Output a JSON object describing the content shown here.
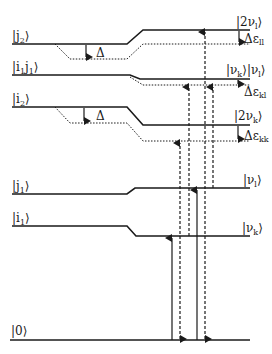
{
  "diagram": {
    "left_levels": [
      {
        "id": "j2",
        "ket": "|j",
        "sub": "2",
        "close": "⟩"
      },
      {
        "id": "i1j1",
        "ket": "|i",
        "sub": "1",
        "ket2": "j",
        "sub2": "1",
        "close": "⟩"
      },
      {
        "id": "i2",
        "ket": "|i",
        "sub": "2",
        "close": "⟩"
      },
      {
        "id": "j1",
        "ket": "|j",
        "sub": "1",
        "close": "⟩"
      },
      {
        "id": "i1",
        "ket": "|i",
        "sub": "1",
        "close": "⟩"
      },
      {
        "id": "zero",
        "ket": "|0",
        "close": "⟩"
      }
    ],
    "right_levels": [
      {
        "id": "2nu_l",
        "ket": "|2ν",
        "sub": "l",
        "close": "⟩"
      },
      {
        "id": "nu_k_nu_l",
        "ket": "|ν",
        "sub": "k",
        "ket2": "⟩|ν",
        "sub2": "l",
        "close": "⟩"
      },
      {
        "id": "2nu_k",
        "ket": "|2ν",
        "sub": "k",
        "close": "⟩"
      },
      {
        "id": "nu_l",
        "ket": "|ν",
        "sub": "l",
        "close": "⟩"
      },
      {
        "id": "nu_k",
        "ket": "|ν",
        "sub": "k",
        "close": "⟩"
      }
    ],
    "shifts": [
      {
        "id": "delta_j2",
        "label": "Δ"
      },
      {
        "id": "delta_i2",
        "label": "Δ"
      }
    ],
    "anharmonicities": [
      {
        "id": "eps_ll",
        "label": "Δε",
        "sub": "ll"
      },
      {
        "id": "eps_kl",
        "label": "Δε",
        "sub": "kl"
      },
      {
        "id": "eps_kk",
        "label": "Δε",
        "sub": "kk"
      }
    ]
  }
}
